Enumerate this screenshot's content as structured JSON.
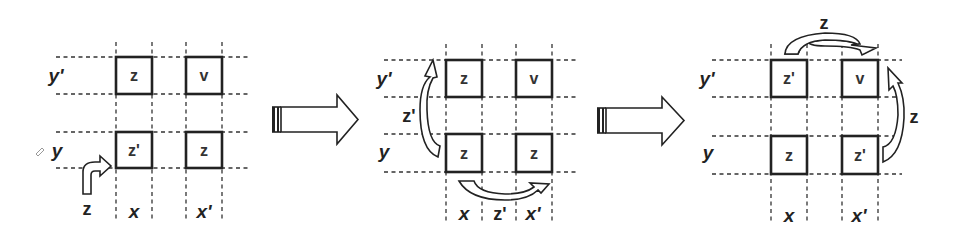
{
  "diagram": {
    "panels": [
      {
        "id": "panel-1",
        "row_labels": {
          "top": "y'",
          "bottom": "y"
        },
        "col_labels": {
          "left": "x",
          "right": "x'"
        },
        "cells": {
          "top_left": "z",
          "top_right": "v",
          "bottom_left": "z'",
          "bottom_right": "z"
        },
        "moves": [
          {
            "label": "z",
            "description": "z enters bottom-left cell (x, y) from below-left"
          }
        ]
      },
      {
        "id": "panel-2",
        "row_labels": {
          "top": "y'",
          "bottom": "y"
        },
        "col_labels": {
          "left": "x",
          "middle": "z'",
          "right": "x'"
        },
        "cells": {
          "top_left": "z",
          "top_right": "v",
          "bottom_left": "z",
          "bottom_right": "z"
        },
        "moves": [
          {
            "label": "z'",
            "description": "z' moves from (x, y) up to (x, y')"
          },
          {
            "label": "z'",
            "description": "z' moves from (x, y) across to (x', y)"
          }
        ]
      },
      {
        "id": "panel-3",
        "row_labels": {
          "top": "y'",
          "bottom": "y"
        },
        "col_labels": {
          "left": "x",
          "right": "x'"
        },
        "cells": {
          "top_left": "z'",
          "top_right": "v",
          "bottom_left": "z",
          "bottom_right": "z'"
        },
        "moves": [
          {
            "label": "z",
            "description": "z moves from (x, y') across to (x', y')"
          },
          {
            "label": "z",
            "description": "z moves from (x', y) up to (x', y')"
          }
        ]
      }
    ],
    "transitions": [
      {
        "from": "panel-1",
        "to": "panel-2",
        "icon": "right-arrow-icon"
      },
      {
        "from": "panel-2",
        "to": "panel-3",
        "icon": "right-arrow-icon"
      }
    ]
  }
}
